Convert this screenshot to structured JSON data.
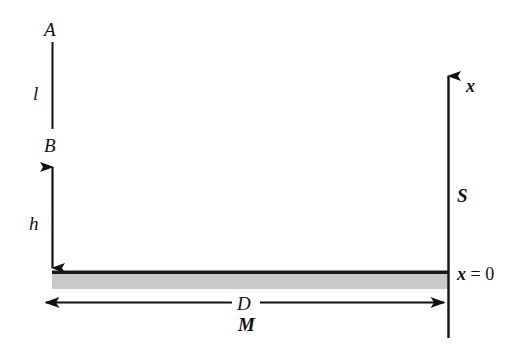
{
  "figure": {
    "type": "schematic-diagram",
    "background_color": "#ffffff",
    "line_color": "#111111",
    "bar_fill_color": "#c9c9c9",
    "bar_border_color": "#1a1a1a",
    "labels": {
      "top_point": "A",
      "segment_length": "l",
      "mid_point": "B",
      "height": "h",
      "width": "D",
      "medium": "M",
      "axis": "x",
      "surface": "S",
      "origin": "x = 0",
      "origin_variable": "x",
      "origin_equals": "=",
      "origin_value": "0"
    },
    "elements": [
      {
        "name": "segment-AB",
        "kind": "vertical-line",
        "label": "l"
      },
      {
        "name": "height-arrow",
        "kind": "double-headed-vertical-arrow",
        "label": "h"
      },
      {
        "name": "gray-slab",
        "kind": "filled-rectangle",
        "label": "M"
      },
      {
        "name": "width-arrow",
        "kind": "double-headed-horizontal-arrow",
        "label": "D"
      },
      {
        "name": "x-axis-arrow",
        "kind": "upward-arrow",
        "label": "x"
      },
      {
        "name": "surface-line",
        "kind": "axis-reference",
        "label": "S"
      }
    ]
  }
}
